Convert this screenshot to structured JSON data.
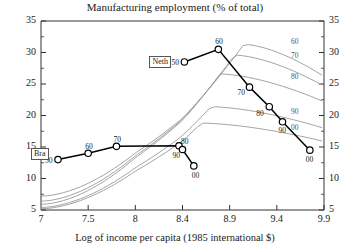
{
  "chart_data": {
    "type": "line",
    "title": "Manufacturing employment (% of total)",
    "xlabel": "Log of income per capita (1985 international $)",
    "ylabel": "",
    "xticklabels": [
      "7",
      "7.5",
      "8",
      "8.4",
      "8.9",
      "9.4",
      "9.9"
    ],
    "yticklabels": [
      "5",
      "10",
      "15",
      "20",
      "25",
      "30",
      "35"
    ],
    "ylim": [
      5,
      35
    ],
    "grid": false,
    "legend": "inline-labels",
    "right_axis": true,
    "right_yticklabels": [
      "5",
      "10",
      "15",
      "20",
      "25",
      "30",
      "35"
    ],
    "series": [
      {
        "name": "Neth",
        "label": "Neth",
        "color": "#000000",
        "marker": "open-circle",
        "points": [
          {
            "decade": "50",
            "x": 8.42,
            "y": 28.5
          },
          {
            "decade": "60",
            "x": 8.78,
            "y": 30.5
          },
          {
            "decade": "70",
            "x": 9.11,
            "y": 24.5
          },
          {
            "decade": "80",
            "x": 9.32,
            "y": 21.4
          },
          {
            "decade": "90",
            "x": 9.46,
            "y": 19.0
          },
          {
            "decade": "00",
            "x": 9.75,
            "y": 14.5
          }
        ]
      },
      {
        "name": "Bra",
        "label": "Bra",
        "color": "#000000",
        "marker": "open-circle",
        "points": [
          {
            "decade": "50",
            "x": 7.18,
            "y": 13.0
          },
          {
            "decade": "60",
            "x": 7.5,
            "y": 14.0
          },
          {
            "decade": "70",
            "x": 7.8,
            "y": 15.1
          },
          {
            "decade": "80",
            "x": 8.37,
            "y": 15.2
          },
          {
            "decade": "90",
            "x": 8.4,
            "y": 14.6
          },
          {
            "decade": "00",
            "x": 8.52,
            "y": 12.0
          }
        ]
      }
    ],
    "cross_section_curves": [
      {
        "decade": "60",
        "color": "#9a9a9a",
        "label_y": 31.6
      },
      {
        "decade": "70",
        "color": "#9a9a9a",
        "label_y": 29.4
      },
      {
        "decade": "80",
        "color": "#9a9a9a",
        "label_y": 26.1
      },
      {
        "decade": "90",
        "color": "#9a9a9a",
        "label_y": 20.6
      },
      {
        "decade": "00",
        "color": "#9a9a9a",
        "label_y": 18.0
      }
    ]
  },
  "colors": {
    "series": "#000000",
    "curves": "#9a9a9a",
    "axis": "#333333",
    "text": "#1a1a1a"
  }
}
